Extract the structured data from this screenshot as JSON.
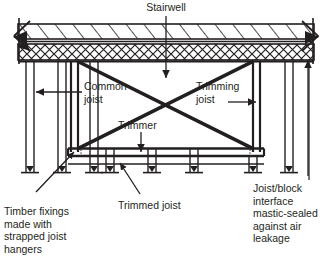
{
  "diagram": {
    "ink": "#231f20",
    "hatch_fill": "#ffffff",
    "labels": {
      "stairwell": "Stairwell",
      "common_joist": "Common\njoist",
      "trimming_joist": "Trimming\njoist",
      "trimmer": "Trimmer",
      "trimmed_joist": "Trimmed joist",
      "timber_fixings": "Timber fixings\nmade with\nstrapped joist\nhangers",
      "joist_block": "Joist/block\ninterface\nmastic-sealed\nagainst air\nleakage"
    },
    "components": {
      "slab_band_top": "diagonal-hatched-screed-band",
      "slab_band_bottom": "cross-hatched-block-band",
      "joist_count_left": 3,
      "joist_count_center": 4,
      "joist_count_right": 2,
      "bracing_pattern": "x-cross",
      "trimmer_beam": "horizontal-double-line-beam",
      "break_lines": 2
    }
  }
}
